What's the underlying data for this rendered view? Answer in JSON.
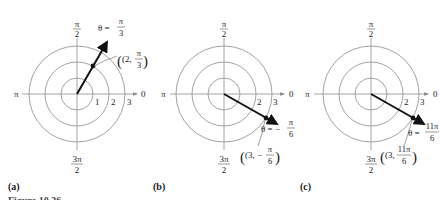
{
  "figure": {
    "caption_partial": "Figure 10.36",
    "axis_labels": {
      "top_num": "π",
      "top_den": "2",
      "left": "π",
      "right": "0",
      "bottom_num": "3π",
      "bottom_den": "2"
    },
    "colors": {
      "circle": "#8a8a8a",
      "axis": "#9a9a9a",
      "vector": "#111111"
    },
    "panels": [
      {
        "label": "(a)",
        "center": [
          77,
          94
        ],
        "radius_unit": 16,
        "ring_labels": [
          "1",
          "2",
          "3"
        ],
        "point": {
          "r": 2,
          "theta": "π/3"
        },
        "theta_label": {
          "prefix": "θ =",
          "num": "π",
          "den": "3"
        },
        "point_label": {
          "open": "(2,",
          "num": "π",
          "den": "3",
          "close": ")"
        }
      },
      {
        "label": "(b)",
        "center": [
          224,
          94
        ],
        "radius_unit": 16,
        "ring_labels": [
          "2",
          "3"
        ],
        "point": {
          "r": 3,
          "theta": "-π/6"
        },
        "theta_label": {
          "prefix": "θ = −",
          "num": "π",
          "den": "6"
        },
        "point_label": {
          "open": "(3, −",
          "num": "π",
          "den": "6",
          "close": ")"
        }
      },
      {
        "label": "(c)",
        "center": [
          371,
          94
        ],
        "radius_unit": 16,
        "ring_labels": [
          "2",
          "3"
        ],
        "point": {
          "r": 3,
          "theta": "11π/6"
        },
        "theta_label": {
          "prefix": "θ =",
          "num": "11π",
          "den": "6"
        },
        "point_label": {
          "open": "(3,",
          "num": "11π",
          "den": "6",
          "close": ")"
        }
      }
    ]
  }
}
